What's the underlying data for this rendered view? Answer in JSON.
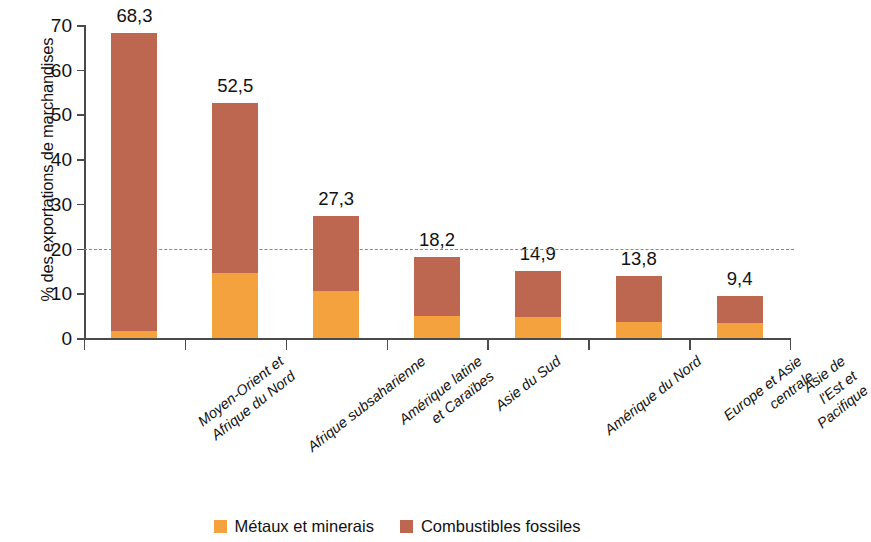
{
  "chart_data": {
    "type": "bar",
    "stacked": true,
    "title": "",
    "xlabel": "",
    "ylabel": "% des exportations de marchandises",
    "ylim": [
      0,
      70
    ],
    "yticks": [
      0,
      10,
      20,
      30,
      40,
      50,
      60,
      70
    ],
    "grid": false,
    "legend_position": "bottom",
    "categories": [
      "Moyen-Orient et\nAfrique du Nord",
      "Afrique subsaharienne",
      "Amérique latine\net Caraïbes",
      "Asie du Sud",
      "Amérique du Nord",
      "Europe et Asie centrale",
      "Asie de l'Est et Pacifique"
    ],
    "series": [
      {
        "name": "Métaux et minerais",
        "color": "#f4a23d",
        "values": [
          1.6,
          14.5,
          10.6,
          5.0,
          4.7,
          3.6,
          3.4
        ]
      },
      {
        "name": "Combustibles fossiles",
        "color": "#bd6751",
        "values": [
          66.7,
          38.0,
          16.7,
          13.2,
          10.2,
          10.2,
          6.0
        ]
      }
    ],
    "totals": [
      68.3,
      52.5,
      27.3,
      18.2,
      14.9,
      13.8,
      9.4
    ],
    "value_labels": [
      "68,3",
      "52,5",
      "27,3",
      "18,2",
      "14,9",
      "13,8",
      "9,4"
    ],
    "annotations": [
      {
        "type": "reference-line",
        "orientation": "horizontal",
        "value": 20,
        "style": "dashed",
        "color": "#5b8fd4"
      }
    ]
  },
  "legend": {
    "items": [
      {
        "label": "Métaux et minerais",
        "color": "#f4a23d"
      },
      {
        "label": "Combustibles fossiles",
        "color": "#bd6751"
      }
    ]
  },
  "axis": {
    "y_title": "% des exportations de marchandises",
    "tick_labels": [
      "0",
      "10",
      "20",
      "30",
      "40",
      "50",
      "60",
      "70"
    ]
  }
}
